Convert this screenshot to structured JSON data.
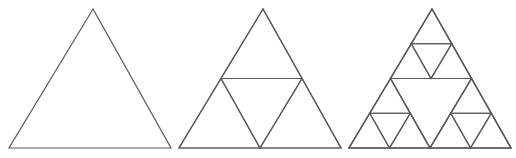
{
  "figure": {
    "stroke_color": "#5a5a5a",
    "background": "#ffffff",
    "stages": [
      {
        "label": "iteration-0",
        "apex": [
          93,
          9
        ],
        "base_left": [
          9,
          148
        ],
        "base_right": [
          171,
          148
        ],
        "depth": 0
      },
      {
        "label": "iteration-1",
        "apex": [
          263,
          9
        ],
        "base_left": [
          179,
          148
        ],
        "base_right": [
          341,
          148
        ],
        "depth": 1
      },
      {
        "label": "iteration-2",
        "apex": [
          432,
          9
        ],
        "base_left": [
          349,
          148
        ],
        "base_right": [
          511,
          148
        ],
        "depth": 2
      }
    ]
  }
}
